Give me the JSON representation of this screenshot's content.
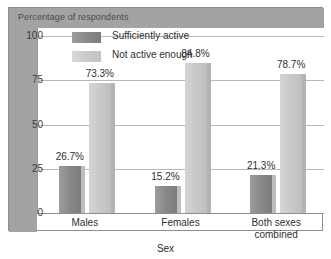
{
  "chart_data": {
    "type": "bar",
    "title": "Percentage of respondents",
    "xlabel": "Sex",
    "ylabel": "",
    "ylim": [
      0,
      100
    ],
    "yticks": [
      "0",
      "25",
      "50",
      "75",
      "100"
    ],
    "grid": true,
    "legend_position": "top-left-inside",
    "categories": [
      "Males",
      "Females",
      "Both sexes combined"
    ],
    "series": [
      {
        "name": "Sufficiently active",
        "color": "#8a8a8a",
        "values": [
          26.7,
          15.2,
          21.3
        ],
        "labels": [
          "26.7%",
          "15.2%",
          "21.3%"
        ]
      },
      {
        "name": "Not active enough",
        "color": "#cbcbcb",
        "values": [
          73.3,
          84.8,
          78.7
        ],
        "labels": [
          "73.3%",
          "84.8%",
          "78.7%"
        ]
      }
    ]
  },
  "categories_display": [
    {
      "line1": "Males",
      "line2": ""
    },
    {
      "line1": "Females",
      "line2": ""
    },
    {
      "line1": "Both sexes",
      "line2": "combined"
    }
  ]
}
